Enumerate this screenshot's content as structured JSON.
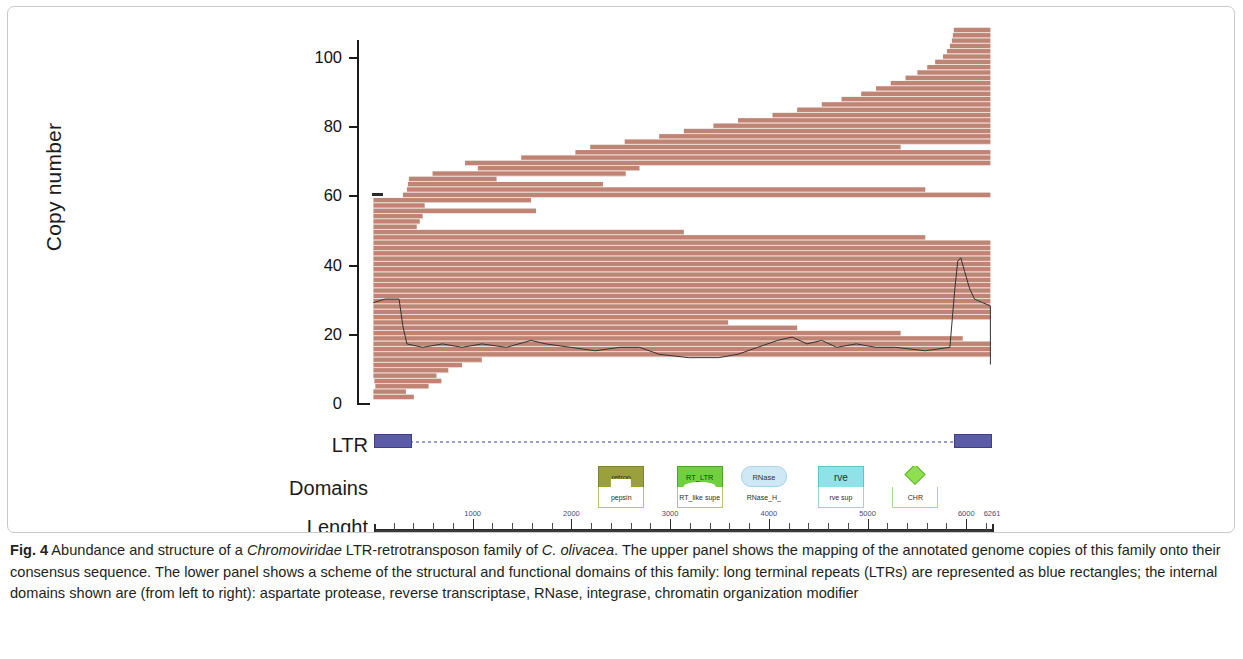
{
  "figure": {
    "label": "Fig. 4",
    "caption_text": " Abundance and structure of a ",
    "caption_italic_1": "Chromoviridae",
    "caption_text_2": " LTR-retrotransposon family of ",
    "caption_italic_2": "C. olivacea",
    "caption_text_3": ". The upper panel shows the mapping of the annotated genome copies of this family onto their consensus sequence. The lower panel shows a scheme of the structural and functional domains of this family: long terminal repeats (LTRs) are represented as blue rectangles; the internal domains shown are (from left to right): aspartate protease, reverse transcriptase, RNase, integrase, chromatin organization modifier"
  },
  "plot": {
    "y_axis_title": "Copy number",
    "y_ticks": [
      "0",
      "20",
      "40",
      "60",
      "80",
      "100"
    ],
    "y_min": 0,
    "y_max": 108,
    "bar_color": "#c08474",
    "coverage_line_color": "#333333"
  },
  "rows": {
    "ltr_label": "LTR",
    "domains_label": "Domains",
    "length_label": "Lenght"
  },
  "ltr_track": {
    "left_ltr": {
      "start": 0,
      "end": 390
    },
    "right_ltr": {
      "start": 5880,
      "end": 6261
    },
    "color": "#5b5ba8"
  },
  "domains": [
    {
      "name": "aspartate-protease",
      "top_label": "retrop",
      "bottom_label": "pepsin",
      "shape": "notch",
      "color": "#9aa03c",
      "start": 2290,
      "end": 2720
    },
    {
      "name": "reverse-transcriptase",
      "top_label": "RT_LTR",
      "bottom_label": "RT_like supe",
      "shape": "arch",
      "color": "#6fd13f",
      "start": 2980,
      "end": 3620
    },
    {
      "name": "rnase",
      "top_label": "RNase",
      "bottom_label": "RNase_H_",
      "shape": "oval",
      "color": "#cfe8f6",
      "start": 3720,
      "end": 4180
    },
    {
      "name": "integrase",
      "top_label": "rve",
      "bottom_label": "rve sup",
      "shape": "box",
      "color": "#8fe3e8",
      "start": 4520,
      "end": 4940
    },
    {
      "name": "chromatin-organization-modifier",
      "top_label": "",
      "bottom_label": "CHR",
      "shape": "diamond",
      "color": "#8ee04e",
      "start": 5330,
      "end": 5640
    }
  ],
  "ruler": {
    "start": 0,
    "end": 6261,
    "major_ticks": [
      1000,
      2000,
      3000,
      4000,
      5000,
      6000
    ],
    "major_labels": [
      "1000",
      "2000",
      "3000",
      "4000",
      "5000",
      "6000"
    ],
    "end_label": "6261",
    "minor_step": 200
  },
  "chart_data": {
    "type": "bar",
    "title": "Abundance and structure of a Chromoviridae LTR-retrotransposon family of C. olivacea",
    "orientation": "horizontal-stacked-reads",
    "xlabel": "Position along consensus sequence (bp)",
    "ylabel": "Copy number",
    "ylim": [
      0,
      108
    ],
    "xlim": [
      0,
      6261
    ],
    "ytick_values": [
      0,
      20,
      40,
      60,
      80,
      100
    ],
    "grid": false,
    "legend": "none",
    "reads": [
      {
        "copy": 1,
        "start": 0,
        "end": 410
      },
      {
        "copy": 2,
        "start": 0,
        "end": 330
      },
      {
        "copy": 3,
        "start": 20,
        "end": 560
      },
      {
        "copy": 4,
        "start": 10,
        "end": 690
      },
      {
        "copy": 5,
        "start": 0,
        "end": 640
      },
      {
        "copy": 6,
        "start": 0,
        "end": 760
      },
      {
        "copy": 7,
        "start": 0,
        "end": 900
      },
      {
        "copy": 8,
        "start": 0,
        "end": 1100
      },
      {
        "copy": 9,
        "start": 0,
        "end": 6261
      },
      {
        "copy": 10,
        "start": 0,
        "end": 6261
      },
      {
        "copy": 11,
        "start": 0,
        "end": 6261
      },
      {
        "copy": 12,
        "start": 0,
        "end": 5980
      },
      {
        "copy": 13,
        "start": 0,
        "end": 5350
      },
      {
        "copy": 14,
        "start": 0,
        "end": 4300
      },
      {
        "copy": 15,
        "start": 0,
        "end": 3600
      },
      {
        "copy": 16,
        "start": 0,
        "end": 6261
      },
      {
        "copy": 17,
        "start": 0,
        "end": 6261
      },
      {
        "copy": 18,
        "start": 0,
        "end": 6261
      },
      {
        "copy": 19,
        "start": 0,
        "end": 6261
      },
      {
        "copy": 20,
        "start": 0,
        "end": 6261
      },
      {
        "copy": 21,
        "start": 0,
        "end": 6261
      },
      {
        "copy": 22,
        "start": 0,
        "end": 6261
      },
      {
        "copy": 23,
        "start": 0,
        "end": 6261
      },
      {
        "copy": 24,
        "start": 0,
        "end": 6261
      },
      {
        "copy": 25,
        "start": 0,
        "end": 6261
      },
      {
        "copy": 26,
        "start": 0,
        "end": 6261
      },
      {
        "copy": 27,
        "start": 0,
        "end": 6261
      },
      {
        "copy": 28,
        "start": 0,
        "end": 6261
      },
      {
        "copy": 29,
        "start": 0,
        "end": 6261
      },
      {
        "copy": 30,
        "start": 0,
        "end": 6261
      },
      {
        "copy": 31,
        "start": 0,
        "end": 5600
      },
      {
        "copy": 32,
        "start": 0,
        "end": 3150
      },
      {
        "copy": 33,
        "start": 0,
        "end": 440
      },
      {
        "copy": 34,
        "start": 0,
        "end": 470
      },
      {
        "copy": 35,
        "start": 0,
        "end": 500
      },
      {
        "copy": 36,
        "start": 0,
        "end": 1650
      },
      {
        "copy": 37,
        "start": 0,
        "end": 520
      },
      {
        "copy": 38,
        "start": 0,
        "end": 1600
      },
      {
        "copy": 39,
        "start": 300,
        "end": 6261
      },
      {
        "copy": 40,
        "start": 340,
        "end": 5600
      },
      {
        "copy": 41,
        "start": 350,
        "end": 2330
      },
      {
        "copy": 42,
        "start": 360,
        "end": 1250
      },
      {
        "copy": 43,
        "start": 600,
        "end": 2560
      },
      {
        "copy": 44,
        "start": 1060,
        "end": 2700
      },
      {
        "copy": 45,
        "start": 930,
        "end": 6261
      },
      {
        "copy": 46,
        "start": 1500,
        "end": 6261
      },
      {
        "copy": 47,
        "start": 2050,
        "end": 6261
      },
      {
        "copy": 48,
        "start": 2200,
        "end": 5350
      },
      {
        "copy": 49,
        "start": 2550,
        "end": 6261
      },
      {
        "copy": 50,
        "start": 2900,
        "end": 6261
      },
      {
        "copy": 51,
        "start": 3150,
        "end": 6261
      },
      {
        "copy": 52,
        "start": 3450,
        "end": 6261
      },
      {
        "copy": 53,
        "start": 3700,
        "end": 6261
      },
      {
        "copy": 54,
        "start": 4050,
        "end": 6261
      },
      {
        "copy": 55,
        "start": 4300,
        "end": 6261
      },
      {
        "copy": 56,
        "start": 4550,
        "end": 6261
      },
      {
        "copy": 57,
        "start": 4750,
        "end": 6261
      },
      {
        "copy": 58,
        "start": 4950,
        "end": 6261
      },
      {
        "copy": 59,
        "start": 5100,
        "end": 6261
      },
      {
        "copy": 60,
        "start": 5250,
        "end": 6261
      },
      {
        "copy": 61,
        "start": 5400,
        "end": 6261
      },
      {
        "copy": 62,
        "start": 5520,
        "end": 6261
      },
      {
        "copy": 63,
        "start": 5620,
        "end": 6261
      },
      {
        "copy": 64,
        "start": 5700,
        "end": 6261
      },
      {
        "copy": 65,
        "start": 5780,
        "end": 6261
      },
      {
        "copy": 66,
        "start": 5820,
        "end": 6261
      },
      {
        "copy": 67,
        "start": 5850,
        "end": 6261
      },
      {
        "copy": 68,
        "start": 5870,
        "end": 6261
      },
      {
        "copy": 69,
        "start": 5880,
        "end": 6261
      },
      {
        "copy": 70,
        "start": 5890,
        "end": 6261
      }
    ],
    "coverage_profile": [
      {
        "x": 0,
        "y": 29
      },
      {
        "x": 120,
        "y": 30
      },
      {
        "x": 260,
        "y": 30
      },
      {
        "x": 300,
        "y": 22
      },
      {
        "x": 340,
        "y": 17
      },
      {
        "x": 500,
        "y": 16
      },
      {
        "x": 700,
        "y": 17
      },
      {
        "x": 900,
        "y": 16
      },
      {
        "x": 1100,
        "y": 17
      },
      {
        "x": 1350,
        "y": 16
      },
      {
        "x": 1600,
        "y": 18
      },
      {
        "x": 1750,
        "y": 17
      },
      {
        "x": 2000,
        "y": 16
      },
      {
        "x": 2250,
        "y": 15
      },
      {
        "x": 2500,
        "y": 16
      },
      {
        "x": 2700,
        "y": 16
      },
      {
        "x": 2900,
        "y": 14
      },
      {
        "x": 3200,
        "y": 13
      },
      {
        "x": 3500,
        "y": 13
      },
      {
        "x": 3700,
        "y": 14
      },
      {
        "x": 3900,
        "y": 16
      },
      {
        "x": 4100,
        "y": 18
      },
      {
        "x": 4250,
        "y": 19
      },
      {
        "x": 4400,
        "y": 17
      },
      {
        "x": 4550,
        "y": 18
      },
      {
        "x": 4700,
        "y": 16
      },
      {
        "x": 4900,
        "y": 17
      },
      {
        "x": 5100,
        "y": 16
      },
      {
        "x": 5300,
        "y": 16
      },
      {
        "x": 5600,
        "y": 15
      },
      {
        "x": 5850,
        "y": 16
      },
      {
        "x": 5900,
        "y": 33
      },
      {
        "x": 5930,
        "y": 41
      },
      {
        "x": 5960,
        "y": 42
      },
      {
        "x": 6000,
        "y": 38
      },
      {
        "x": 6050,
        "y": 33
      },
      {
        "x": 6100,
        "y": 30
      },
      {
        "x": 6180,
        "y": 29
      },
      {
        "x": 6261,
        "y": 28
      }
    ]
  }
}
